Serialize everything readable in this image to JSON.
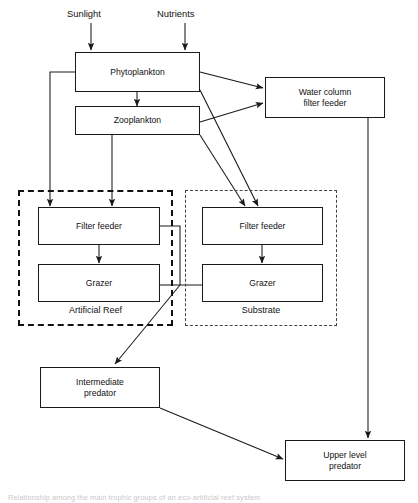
{
  "figure": {
    "caption": "Relationship among the main trophic groups of an eco-artificial reef system"
  },
  "inputs": [
    {
      "name": "sunlight",
      "label": "Sunlight"
    },
    {
      "name": "nutrients",
      "label": "Nutrients"
    }
  ],
  "nodes": {
    "phytoplankton": {
      "label": "Phytoplankton"
    },
    "zooplankton": {
      "label": "Zooplankton"
    },
    "water_column_filter_feeder": {
      "line1": "Water column",
      "line2": "filter feeder"
    },
    "reef_filter_feeder": {
      "label": "Filter feeder"
    },
    "reef_grazer": {
      "label": "Grazer"
    },
    "substrate_filter_feeder": {
      "label": "Filter feeder"
    },
    "substrate_grazer": {
      "label": "Grazer"
    },
    "intermediate_predator": {
      "line1": "Intermediate",
      "line2": "predator"
    },
    "upper_level_predator": {
      "line1": "Upper level",
      "line2": "predator"
    }
  },
  "groups": {
    "artificial_reef": {
      "label": "Artificial Reef",
      "border_style": "dashed-heavy"
    },
    "substrate": {
      "label": "Substrate",
      "border_style": "dashed-light"
    }
  },
  "colors": {
    "line": "#1a1a1a",
    "box_border": "#1a1a1a",
    "background": "#ffffff",
    "group_reef_border": "#111111",
    "group_substrate_border": "#444444"
  },
  "connections": [
    {
      "from": "sunlight",
      "to": "phytoplankton",
      "type": "arrow"
    },
    {
      "from": "nutrients",
      "to": "phytoplankton",
      "type": "arrow"
    },
    {
      "from": "phytoplankton",
      "to": "zooplankton",
      "type": "arrow"
    },
    {
      "from": "phytoplankton",
      "to": "water_column_filter_feeder",
      "type": "arrow"
    },
    {
      "from": "zooplankton",
      "to": "water_column_filter_feeder",
      "type": "arrow"
    },
    {
      "from": "phytoplankton",
      "to": "reef_filter_feeder",
      "type": "arrow"
    },
    {
      "from": "zooplankton",
      "to": "reef_filter_feeder",
      "type": "arrow"
    },
    {
      "from": "phytoplankton",
      "to": "substrate_filter_feeder",
      "type": "arrow"
    },
    {
      "from": "zooplankton",
      "to": "substrate_filter_feeder",
      "type": "arrow"
    },
    {
      "from": "reef_filter_feeder",
      "to": "reef_grazer",
      "type": "arrow"
    },
    {
      "from": "substrate_filter_feeder",
      "to": "substrate_grazer",
      "type": "arrow"
    },
    {
      "from": "reef_filter_feeder",
      "to": "substrate_filter_feeder",
      "type": "line"
    },
    {
      "from": "reef_grazer",
      "to": "substrate_grazer",
      "type": "line"
    },
    {
      "from": "reef_grazer",
      "to": "intermediate_predator",
      "type": "arrow"
    },
    {
      "from": "intermediate_predator",
      "to": "upper_level_predator",
      "type": "arrow"
    },
    {
      "from": "water_column_filter_feeder",
      "to": "upper_level_predator",
      "type": "arrow"
    }
  ]
}
